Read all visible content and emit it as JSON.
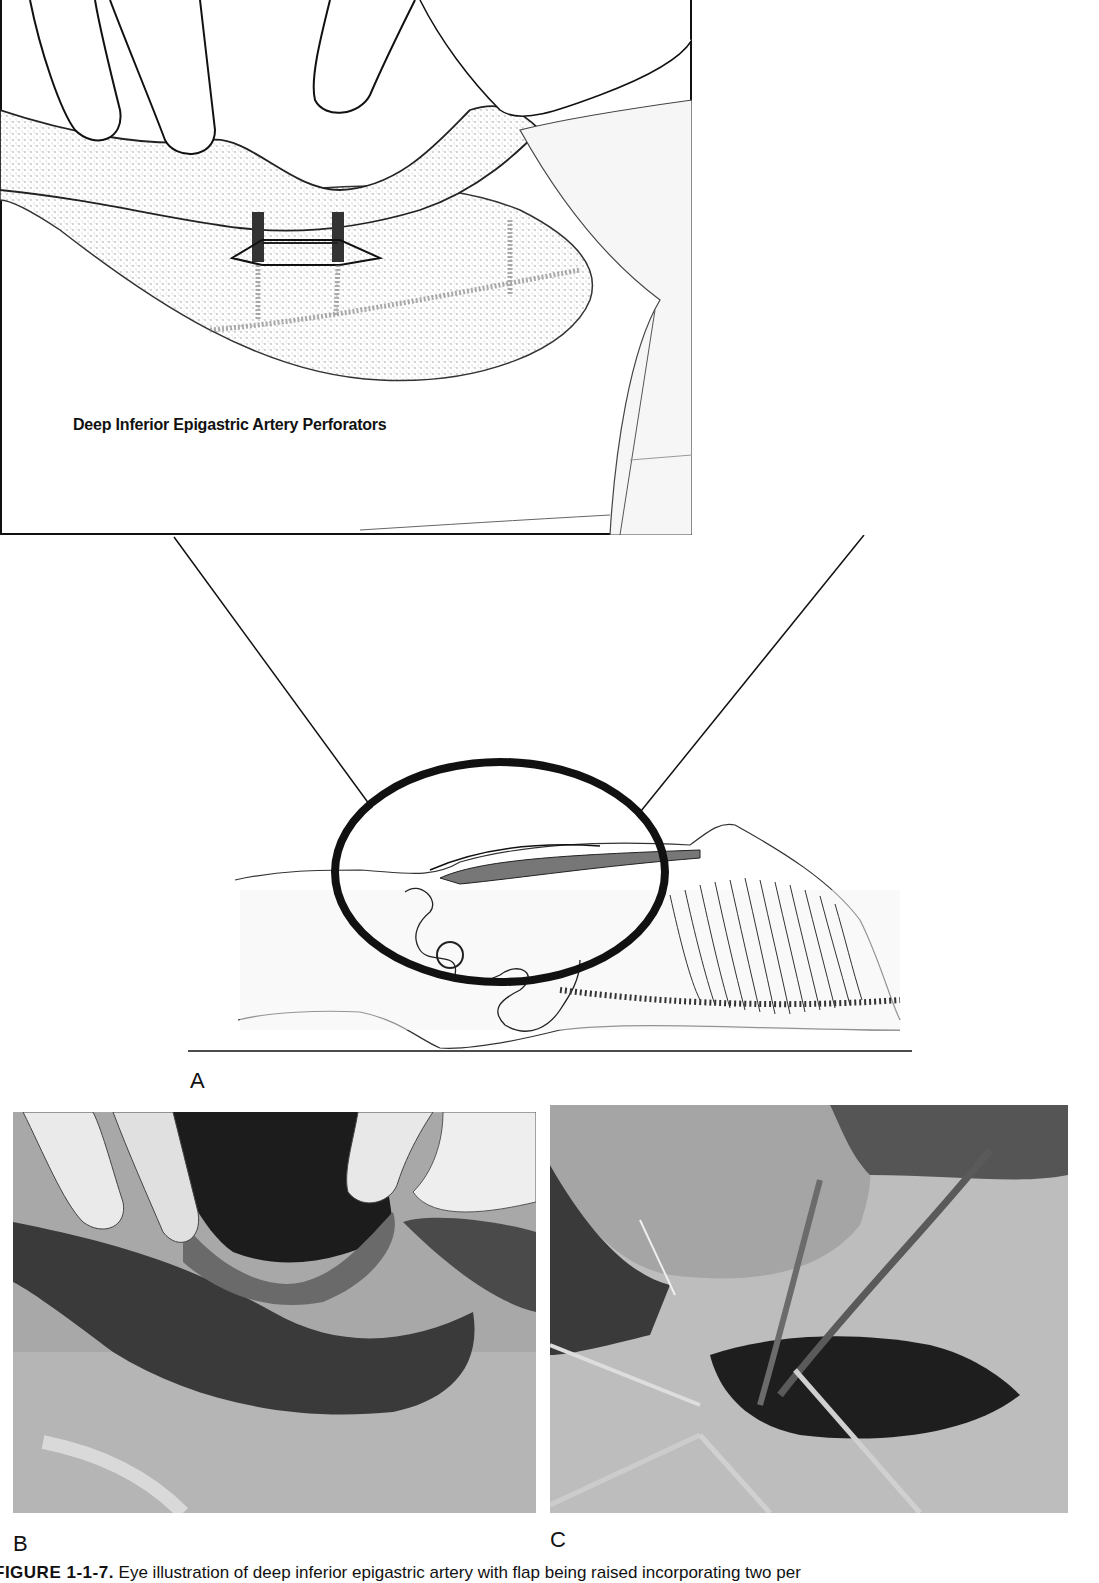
{
  "figure": {
    "panels": [
      {
        "id": "A",
        "label": "A",
        "type": "illustration",
        "inset_annotation": "Deep Inferior Epigastric Artery Perforators",
        "description": "Line drawing of surgeon's fingers lifting abdominal skin flap with two perforator vessels; below, full-body side view of supine patient with circled abdominal region, connector lines to inset"
      },
      {
        "id": "B",
        "label": "B",
        "type": "photograph",
        "description": "Intraoperative photo: fingers lifting raised abdominal flap"
      },
      {
        "id": "C",
        "label": "C",
        "type": "photograph",
        "description": "Intraoperative photo: dissected perforator vessel with retractors and forceps"
      }
    ],
    "caption": {
      "prefix": "FIGURE 1-1-7.",
      "text": "Eye illustration of deep inferior epigastric artery with flap being raised incorporating two per"
    }
  }
}
